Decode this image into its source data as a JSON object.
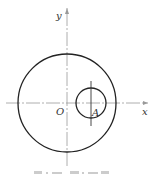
{
  "diagram": {
    "labels": {
      "x_axis": "x",
      "y_axis": "y",
      "origin": "O",
      "point_a": "A"
    },
    "caption": "[illegible faded caption text]",
    "colors": {
      "stroke": "#222222",
      "axis": "#999999",
      "background": "#ffffff"
    },
    "shapes": {
      "large_circle": {
        "center": [
          67,
          103
        ],
        "radius": 49
      },
      "small_circle": {
        "center": [
          91,
          103
        ],
        "radius": 15
      }
    }
  }
}
